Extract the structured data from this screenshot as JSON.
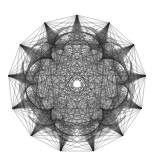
{
  "image": {
    "title": "Star polygon chord figure",
    "width": 157,
    "height": 165,
    "background_color": "#ffffff"
  },
  "figure": {
    "name": "star-chord-rosette",
    "center_x": 77,
    "center_y": 84,
    "outer_radius": 69,
    "points_count": 13,
    "line_color": "#262626",
    "line_width": 0.32,
    "line_opacity": 0.62,
    "center_dot_radius": 3.6,
    "center_dot_color": "#ffffff",
    "ring_nodes": 312,
    "ring_radius": 52,
    "step": 5
  },
  "chart_data": {
    "type": "line",
    "subtitle": "13-point star rosette from circular chords",
    "xlabel": "",
    "ylabel": "",
    "grid": false,
    "legend": "none",
    "xlim": [
      -69,
      69
    ],
    "ylim": [
      -69,
      69
    ],
    "star_points": 13,
    "star_outer_radius": 69,
    "star_inner_radius": 40,
    "chord_nodes": 312,
    "chord_step": 5,
    "center": [
      77,
      84
    ],
    "series": [
      {
        "name": "outer-star-envelope",
        "description": "13 cusped petals forming the outer star silhouette",
        "values": [
          69,
          40,
          69,
          40,
          69,
          40,
          69,
          40,
          69,
          40,
          69,
          40,
          69,
          40,
          69,
          40,
          69,
          40,
          69,
          40,
          69,
          40,
          69,
          40,
          69,
          40
        ]
      },
      {
        "name": "interior-chord-mesh",
        "description": "Chords connecting node i to node (i*step) mod N on a circle of radius 52",
        "values": [
          52,
          52,
          52,
          52,
          52,
          52,
          52,
          52,
          52,
          52,
          52,
          52,
          52
        ]
      }
    ],
    "tick_labels": []
  }
}
